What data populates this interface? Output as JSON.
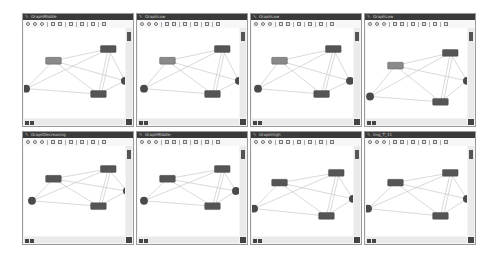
{
  "panels": [
    {
      "title": "GraphMiddle",
      "nodes": {
        "a": [
          22,
          30,
          "#8a8a8a"
        ],
        "b": [
          78,
          18,
          "#555555"
        ],
        "c": [
          68,
          64,
          "#555555"
        ],
        "d": [
          2,
          62,
          "circle"
        ],
        "e": [
          103,
          54,
          "circle"
        ]
      }
    },
    {
      "title": "GraphLow",
      "nodes": {
        "a": [
          22,
          30,
          "#8a8a8a"
        ],
        "b": [
          78,
          18,
          "#555555"
        ],
        "c": [
          68,
          64,
          "#555555"
        ],
        "d": [
          6,
          62,
          "circle"
        ],
        "e": [
          103,
          54,
          "circle"
        ]
      }
    },
    {
      "title": "GraphLow",
      "nodes": {
        "a": [
          20,
          30,
          "#8a8a8a"
        ],
        "b": [
          75,
          18,
          "#555555"
        ],
        "c": [
          63,
          64,
          "#555555"
        ],
        "d": [
          6,
          62,
          "circle"
        ],
        "e": [
          100,
          54,
          "circle"
        ]
      }
    },
    {
      "title": "GraphLow",
      "nodes": {
        "a": [
          22,
          35,
          "#8a8a8a"
        ],
        "b": [
          78,
          22,
          "#555555"
        ],
        "c": [
          68,
          72,
          "#555555"
        ],
        "d": [
          4,
          70,
          "circle"
        ],
        "e": [
          103,
          54,
          "circle"
        ]
      }
    },
    {
      "title": "GraphDecreasing",
      "nodes": {
        "a": [
          22,
          30,
          "#555555"
        ],
        "b": [
          78,
          20,
          "#555555"
        ],
        "c": [
          68,
          58,
          "#555555"
        ],
        "d": [
          8,
          56,
          "circle"
        ],
        "e": [
          105,
          46,
          "circle"
        ]
      }
    },
    {
      "title": "GraphMiddle",
      "nodes": {
        "a": [
          22,
          30,
          "#555555"
        ],
        "b": [
          78,
          20,
          "#555555"
        ],
        "c": [
          68,
          58,
          "#555555"
        ],
        "d": [
          6,
          56,
          "circle"
        ],
        "e": [
          100,
          46,
          "circle"
        ]
      }
    },
    {
      "title": "GraphHigh",
      "nodes": {
        "a": [
          20,
          34,
          "#555555"
        ],
        "b": [
          78,
          24,
          "#555555"
        ],
        "c": [
          68,
          68,
          "#555555"
        ],
        "d": [
          2,
          64,
          "circle"
        ],
        "e": [
          103,
          54,
          "circle"
        ]
      }
    },
    {
      "title": "Img_T_11",
      "nodes": {
        "a": [
          22,
          34,
          "#555555"
        ],
        "b": [
          78,
          24,
          "#555555"
        ],
        "c": [
          68,
          68,
          "#555555"
        ],
        "d": [
          2,
          64,
          "circle"
        ],
        "e": [
          103,
          54,
          "circle"
        ]
      }
    }
  ],
  "toolbar": {
    "icons": [
      "zoom-in-icon",
      "fit-icon",
      "zoom-out-icon",
      "layout-icon",
      "grid-icon",
      "copy-icon",
      "print-icon",
      "check-icon",
      "info-icon"
    ]
  },
  "colors": {
    "titlebar": "#3a3a3a",
    "edge": "#c8c8c8",
    "node_dark": "#555555",
    "node_light": "#8a8a8a"
  }
}
